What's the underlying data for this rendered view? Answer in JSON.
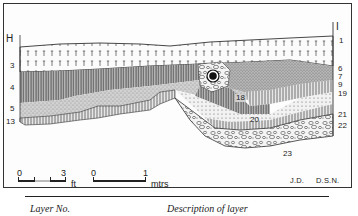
{
  "figure": {
    "section_ends": {
      "left": "H",
      "right": "I"
    },
    "left_layer_labels": [
      "3",
      "4",
      "5",
      "13"
    ],
    "right_layer_labels": [
      "1",
      "6",
      "7",
      "9",
      "19",
      "21",
      "22"
    ],
    "inner_labels": [
      "18",
      "20",
      "23"
    ],
    "scales": {
      "feet": {
        "start": "0",
        "end": "3",
        "unit": "ft"
      },
      "metres": {
        "start": "0",
        "end": "1",
        "unit": "mtrs"
      }
    },
    "credits": [
      "J.D.",
      "D.S.N."
    ]
  },
  "table_header": {
    "col1": "Layer No.",
    "col2": "Description of layer"
  },
  "colors": {
    "ink": "#222222",
    "paper": "#ffffff",
    "hatch_dark": "#555555",
    "stipple": "#9a9a9a"
  }
}
